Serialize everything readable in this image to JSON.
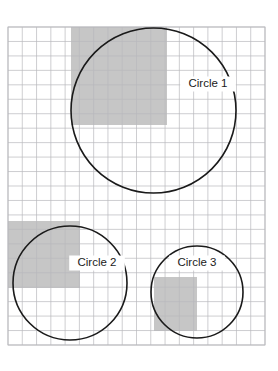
{
  "figure": {
    "background_color": "#ffffff",
    "width": 278,
    "height": 371
  },
  "grid": {
    "name": "square-grid",
    "x": 8,
    "y": 27,
    "width": 257,
    "height": 318,
    "columns": 18,
    "rows": 22,
    "cell_width": 14.28,
    "cell_height": 14.45,
    "line_color": "#b9b9bd",
    "line_width": 0.7,
    "border_color": "#b9b9bd",
    "fill_color": "#ffffff",
    "visible": true
  },
  "shading": {
    "fill_color": "#c6c6c6",
    "opacity": 1,
    "description": "Gray shaded rectangular cell blocks marking the bounding squares of each circle quadrant"
  },
  "chart_data": {
    "type": "diagram",
    "xlabel": "",
    "ylabel": "",
    "grid": true,
    "legend": "none",
    "axis_units": "grid cells",
    "grid_columns": 18,
    "grid_rows": 22,
    "circles": [
      {
        "label": "Circle 1",
        "cx": 153.5,
        "cy": 110.5,
        "r": 82.5,
        "cx_cells": 10.2,
        "cy_cells": 5.8,
        "r_cells": 5.77,
        "stroke": "#1a1a1a",
        "stroke_width": 1.6,
        "fill": "none",
        "label_x": 208,
        "label_y": 84
      },
      {
        "label": "Circle 2",
        "cx": 70,
        "cy": 283,
        "r": 57,
        "cx_cells": 4.34,
        "cy_cells": 17.72,
        "r_cells": 3.99,
        "stroke": "#1a1a1a",
        "stroke_width": 1.6,
        "fill": "none",
        "label_x": 97,
        "label_y": 263
      },
      {
        "label": "Circle 3",
        "cx": 197,
        "cy": 292,
        "r": 46,
        "cx_cells": 13.23,
        "cy_cells": 18.34,
        "r_cells": 3.22,
        "stroke": "#1a1a1a",
        "stroke_width": 1.6,
        "fill": "none",
        "label_x": 197,
        "label_y": 263
      }
    ],
    "shaded_regions": [
      {
        "for_circle": "Circle 1",
        "x": 71,
        "y": 27,
        "width": 96,
        "height": 98,
        "cols": 6.7,
        "rows": 6.8,
        "color": "#c6c6c6"
      },
      {
        "for_circle": "Circle 2",
        "x": 8,
        "y": 221,
        "width": 72,
        "height": 67,
        "cols": 5.0,
        "rows": 4.6,
        "color": "#c6c6c6"
      },
      {
        "for_circle": "Circle 3",
        "x": 154,
        "y": 277,
        "width": 43,
        "height": 54,
        "cols": 3.0,
        "rows": 3.7,
        "color": "#c6c6c6"
      }
    ]
  }
}
